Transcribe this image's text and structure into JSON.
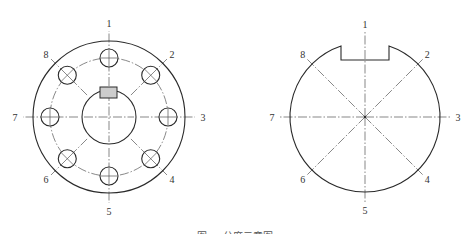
{
  "figure": {
    "caption": "图 … 分度示意图",
    "stroke_color": "#2a2a2a",
    "centerline_color": "#555555",
    "keyway_fill": "#cccccc"
  },
  "left_view": {
    "name": "flange-with-bolt-holes",
    "center": [
      109,
      117
    ],
    "outer_radius": 76,
    "bolt_circle_radius": 59,
    "bore_radius": 27,
    "hole_radius": 9,
    "keyway": {
      "x": 100,
      "y": 87,
      "width": 17,
      "height": 11
    },
    "positions": [
      {
        "label": "1",
        "angle_deg": 90,
        "hole_mark": "cross"
      },
      {
        "label": "2",
        "angle_deg": 45,
        "hole_mark": "x"
      },
      {
        "label": "3",
        "angle_deg": 0,
        "hole_mark": "cross"
      },
      {
        "label": "4",
        "angle_deg": -45,
        "hole_mark": "x"
      },
      {
        "label": "5",
        "angle_deg": -90,
        "hole_mark": "cross"
      },
      {
        "label": "6",
        "angle_deg": -135,
        "hole_mark": "x"
      },
      {
        "label": "7",
        "angle_deg": 180,
        "hole_mark": "cross"
      },
      {
        "label": "8",
        "angle_deg": 135,
        "hole_mark": "x"
      }
    ]
  },
  "right_view": {
    "name": "notched-disc",
    "center": [
      365,
      117
    ],
    "radius": 75,
    "notch": {
      "x_left": 341,
      "x_right": 389,
      "bottom_y": 60
    },
    "positions": [
      {
        "label": "1",
        "angle_deg": 90
      },
      {
        "label": "2",
        "angle_deg": 45
      },
      {
        "label": "3",
        "angle_deg": 0
      },
      {
        "label": "4",
        "angle_deg": -45
      },
      {
        "label": "5",
        "angle_deg": -90
      },
      {
        "label": "6",
        "angle_deg": -135
      },
      {
        "label": "7",
        "angle_deg": 180
      },
      {
        "label": "8",
        "angle_deg": 135
      }
    ]
  }
}
